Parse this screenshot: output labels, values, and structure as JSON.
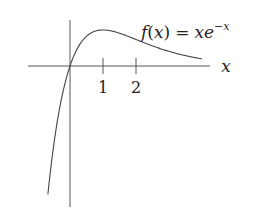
{
  "chart_data": {
    "type": "line",
    "title": "",
    "function_label": "f(x) = xe^{-x}",
    "xlabel": "x",
    "ylabel": "",
    "x_ticks": [
      1,
      2
    ],
    "tick_labels": [
      "1",
      "2"
    ],
    "xlim": [
      -1.3,
      4.2
    ],
    "ylim": [
      -1.4,
      0.48
    ],
    "grid": false,
    "legend": "none",
    "series": [
      {
        "name": "f(x) = xe^{-x}",
        "x": [
          -0.67,
          -0.5,
          -0.25,
          0,
          0.25,
          0.5,
          1,
          1.5,
          2,
          2.5,
          3,
          3.5,
          4
        ],
        "values": [
          -1.31,
          -0.82,
          -0.32,
          0,
          0.19,
          0.3,
          0.37,
          0.33,
          0.27,
          0.21,
          0.15,
          0.11,
          0.07
        ]
      }
    ],
    "annotations": [
      {
        "text": "f(x) = xe^{-x}",
        "position": "upper right, near curve"
      },
      {
        "text": "x",
        "position": "right end of x-axis"
      }
    ]
  },
  "labels": {
    "f": "f",
    "paren_open": "(",
    "x_var": "x",
    "paren_close": ")",
    "eq": "=",
    "xe": "xe",
    "exponent": "−x",
    "axis_x": "x",
    "tick1": "1",
    "tick2": "2"
  },
  "colors": {
    "ink": "#333333",
    "background": "#ffffff"
  }
}
